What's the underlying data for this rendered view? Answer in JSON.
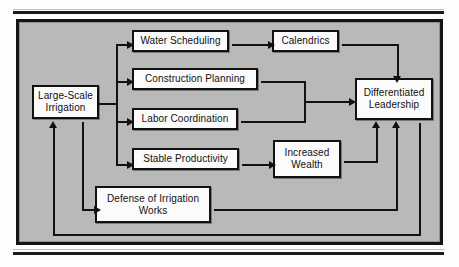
{
  "figure": {
    "type": "flowchart",
    "background_color": "#b9b9b9",
    "node_fill_color": "#fbfbfb",
    "line_color": "#111111",
    "nodes": [
      {
        "id": "large_scale_irrigation",
        "label": "Large-Scale\nIrrigation",
        "x": 32,
        "y": 85,
        "w": 67,
        "h": 34
      },
      {
        "id": "water_scheduling",
        "label": "Water Scheduling",
        "x": 132,
        "y": 30,
        "w": 97,
        "h": 22
      },
      {
        "id": "calendrics",
        "label": "Calendrics",
        "x": 272,
        "y": 30,
        "w": 67,
        "h": 22
      },
      {
        "id": "construction_planning",
        "label": "Construction Planning",
        "x": 132,
        "y": 68,
        "w": 126,
        "h": 22
      },
      {
        "id": "labor_coordination",
        "label": "Labor Coordination",
        "x": 132,
        "y": 108,
        "w": 106,
        "h": 22
      },
      {
        "id": "stable_productivity",
        "label": "Stable Productivity",
        "x": 132,
        "y": 148,
        "w": 107,
        "h": 22
      },
      {
        "id": "increased_wealth",
        "label": "Increased\nWealth",
        "x": 273,
        "y": 140,
        "w": 68,
        "h": 38
      },
      {
        "id": "defense_of_irrigation",
        "label": "Defense of Irrigation\nWorks",
        "x": 95,
        "y": 186,
        "w": 116,
        "h": 37
      },
      {
        "id": "differentiated_leadership",
        "label": "Differentiated\nLeadership",
        "x": 355,
        "y": 78,
        "w": 78,
        "h": 42
      }
    ],
    "edges": [
      {
        "from": "large_scale_irrigation",
        "to": "water_scheduling"
      },
      {
        "from": "large_scale_irrigation",
        "to": "construction_planning"
      },
      {
        "from": "large_scale_irrigation",
        "to": "labor_coordination"
      },
      {
        "from": "large_scale_irrigation",
        "to": "stable_productivity"
      },
      {
        "from": "large_scale_irrigation",
        "to": "defense_of_irrigation"
      },
      {
        "from": "water_scheduling",
        "to": "calendrics"
      },
      {
        "from": "calendrics",
        "to": "differentiated_leadership"
      },
      {
        "from": "construction_planning",
        "to": "differentiated_leadership"
      },
      {
        "from": "labor_coordination",
        "to": "differentiated_leadership"
      },
      {
        "from": "stable_productivity",
        "to": "increased_wealth"
      },
      {
        "from": "increased_wealth",
        "to": "differentiated_leadership"
      },
      {
        "from": "defense_of_irrigation",
        "to": "differentiated_leadership"
      },
      {
        "from": "differentiated_leadership",
        "to": "large_scale_irrigation"
      }
    ]
  }
}
